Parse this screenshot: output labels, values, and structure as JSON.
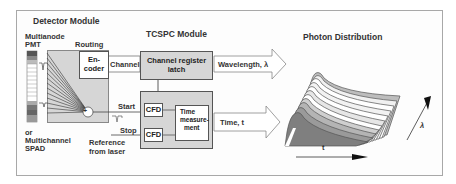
{
  "detector_module": {
    "title": "Detector Module",
    "pmt_label_line1": "Multianode",
    "pmt_label_line2": "PMT",
    "routing_label": "Routing",
    "encoder_line1": "En-",
    "encoder_line2": "coder",
    "alt_label_line1": "or",
    "alt_label_line2": "Multichannel",
    "alt_label_line3": "SPAD",
    "summing_symbol": "+"
  },
  "signals": {
    "channel": "Channel",
    "start": "Start",
    "stop": "Stop",
    "reference_line1": "Reference",
    "reference_line2": "from laser"
  },
  "tcspc_module": {
    "title": "TCSPC Module",
    "register_line1": "Channel register",
    "register_line2": "latch",
    "cfd_start": "CFD",
    "cfd_stop": "CFD",
    "time_meas_line1": "Time",
    "time_meas_line2": "measure-",
    "time_meas_line3": "ment"
  },
  "outputs": {
    "wavelength": "Wavelength, λ",
    "time": "Time, t"
  },
  "photon_distribution": {
    "title": "Photon Distribution",
    "x_axis_label": "t",
    "depth_axis_label": "λ",
    "curve_count": 10
  },
  "colors": {
    "module_fill": "#d6d6d6",
    "frame_border": "#a8a8a8",
    "line": "#555555"
  }
}
